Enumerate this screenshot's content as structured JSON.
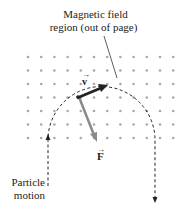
{
  "title_label": {
    "line1": "Magnetic field",
    "line2": "region (out of page)"
  },
  "velocity_label": "v",
  "force_label": "F",
  "motion_label": {
    "line1": "Particle",
    "line2": "motion"
  },
  "grid": {
    "rows": 7,
    "cols": 12,
    "x0": 28,
    "y0": 57,
    "dx": 13.2,
    "dy": 13.5,
    "dot_color": "#a8a8a8"
  },
  "colors": {
    "velocity": "#222222",
    "force": "#8a8a8a",
    "path": "#222222"
  }
}
